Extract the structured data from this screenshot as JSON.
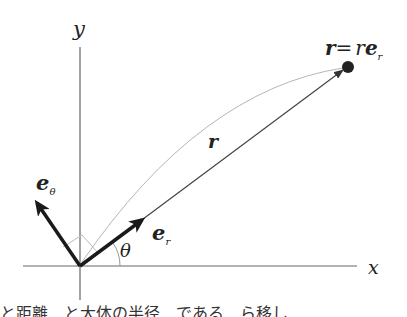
{
  "diagram": {
    "axes": {
      "x_label": "x",
      "y_label": "y",
      "origin": [
        80,
        266
      ]
    },
    "labels": {
      "position_lhs": "r",
      "position_eq": "=",
      "position_rhs_scalar": "r",
      "position_rhs_vec": "e",
      "position_rhs_sub": "r",
      "r_vector": "r",
      "e_r_main": "e",
      "e_r_sub": "r",
      "e_theta_main": "e",
      "e_theta_sub": "θ",
      "angle": "θ"
    },
    "colors": {
      "axis": "#555555",
      "vector": "#333333",
      "unit_vector": "#1a1a1a",
      "curve": "#aaaaaa",
      "helper": "#bbbbbb"
    },
    "caption": "と距離　と大体の半径　である…ら移し"
  }
}
